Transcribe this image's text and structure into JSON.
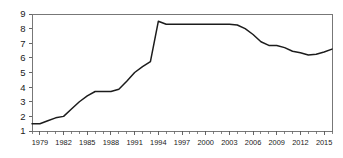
{
  "chart_data": {
    "type": "line",
    "title": "",
    "subtitle": "",
    "xlabel": "",
    "ylabel": "",
    "xlim": [
      1978,
      2016
    ],
    "ylim": [
      1,
      9
    ],
    "grid": false,
    "legend": "none",
    "y_ticks": [
      1,
      2,
      3,
      4,
      5,
      6,
      7,
      8,
      9
    ],
    "y_tick_labels": [
      "1",
      "2",
      "3",
      "4",
      "5",
      "6",
      "7",
      "8",
      "9"
    ],
    "x_ticks": [
      1979,
      1982,
      1985,
      1988,
      1991,
      1994,
      1997,
      2000,
      2003,
      2006,
      2009,
      2012,
      2015
    ],
    "x_tick_labels": [
      "1979",
      "1982",
      "1985",
      "1988",
      "1991",
      "1994",
      "1997",
      "2000",
      "2003",
      "2006",
      "2009",
      "2012",
      "2015"
    ],
    "x_minor_tick_step": 1,
    "line_color": "#1c1c1c",
    "series": [
      {
        "name": "series-1",
        "x": [
          1978,
          1979,
          1980,
          1981,
          1982,
          1983,
          1984,
          1985,
          1986,
          1987,
          1988,
          1989,
          1990,
          1991,
          1992,
          1993,
          1994,
          1995,
          1996,
          1997,
          1998,
          1999,
          2000,
          2001,
          2002,
          2003,
          2004,
          2005,
          2006,
          2007,
          2008,
          2009,
          2010,
          2011,
          2012,
          2013,
          2014,
          2015,
          2016
        ],
        "values": [
          1.5,
          1.5,
          1.7,
          1.9,
          2.0,
          2.5,
          3.0,
          3.4,
          3.7,
          3.7,
          3.7,
          3.85,
          4.4,
          5.0,
          5.4,
          5.75,
          8.5,
          8.3,
          8.3,
          8.3,
          8.3,
          8.3,
          8.3,
          8.3,
          8.3,
          8.3,
          8.25,
          8.0,
          7.6,
          7.1,
          6.85,
          6.85,
          6.7,
          6.45,
          6.35,
          6.2,
          6.25,
          6.4,
          6.6
        ]
      }
    ]
  }
}
